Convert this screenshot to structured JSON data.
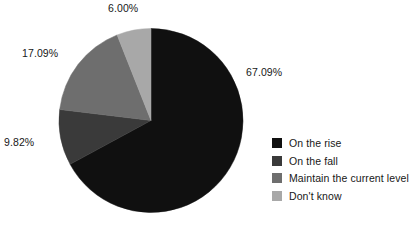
{
  "chart_data": {
    "type": "pie",
    "title": "",
    "categories": [
      "On the rise",
      "On the fall",
      "Maintain the current level",
      "Don't know"
    ],
    "values": [
      67.09,
      9.82,
      17.09,
      6.0
    ],
    "value_labels": [
      "67.09%",
      "9.82%",
      "17.09%",
      "6.00%"
    ],
    "colors": [
      "#101010",
      "#3a3a3a",
      "#6e6e6e",
      "#a8a8a8"
    ],
    "units": "percent",
    "start_angle_deg": 0,
    "direction": "clockwise",
    "legend_position": "right",
    "grid": false,
    "labels_outside": true
  },
  "legend": {
    "items": [
      {
        "label": "On the rise",
        "color": "#101010"
      },
      {
        "label": "On the fall",
        "color": "#3a3a3a"
      },
      {
        "label": "Maintain the current level",
        "color": "#6e6e6e"
      },
      {
        "label": "Don't know",
        "color": "#a8a8a8"
      }
    ]
  }
}
